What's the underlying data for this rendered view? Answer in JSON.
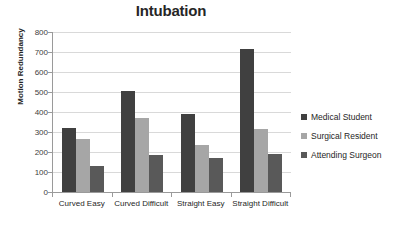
{
  "chart_data": {
    "type": "bar",
    "title": "Intubation",
    "xlabel": "",
    "ylabel": "Motion Redundancy",
    "ylim": [
      0,
      800
    ],
    "ytick_step": 100,
    "yticks": [
      800,
      700,
      600,
      500,
      400,
      300,
      200,
      100,
      0
    ],
    "grid": true,
    "legend_position": "right",
    "categories": [
      "Curved Easy",
      "Curved Difficult",
      "Straight Easy",
      "Straight Difficult"
    ],
    "series": [
      {
        "name": "Medical Student",
        "color": "#404040",
        "values": [
          320,
          505,
          390,
          715
        ]
      },
      {
        "name": "Surgical Resident",
        "color": "#a6a6a6",
        "values": [
          265,
          368,
          235,
          315
        ]
      },
      {
        "name": "Attending Surgeon",
        "color": "#595959",
        "values": [
          128,
          187,
          172,
          190
        ]
      }
    ]
  },
  "colors": {
    "gridline": "#d9d9d9",
    "axis": "#9a9a9a",
    "text": "#262626",
    "background": "#ffffff"
  }
}
